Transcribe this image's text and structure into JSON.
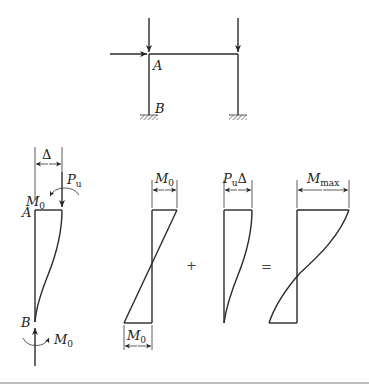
{
  "frame": {
    "joint_top_left": "A",
    "base_left": "B",
    "loads": [
      "horizontal-load-at-A",
      "vertical-load-left-column",
      "vertical-load-right-column"
    ]
  },
  "column_free_body": {
    "top_label": "A",
    "bottom_label": "B",
    "deflection_label": "Δ",
    "axial_load_label": "P",
    "axial_load_sub": "u",
    "top_moment_label": "M",
    "top_moment_sub": "0",
    "bottom_moment_label": "M",
    "bottom_moment_sub": "0"
  },
  "moment_diagrams": {
    "primary": {
      "top_label": "M",
      "top_sub": "0",
      "bottom_label": "M",
      "bottom_sub": "0"
    },
    "operator_plus": "+",
    "secondary": {
      "label": "P",
      "label_sub": "u",
      "label_suffix": "Δ"
    },
    "operator_equals": "=",
    "total": {
      "label": "M",
      "label_sub": "max"
    }
  }
}
